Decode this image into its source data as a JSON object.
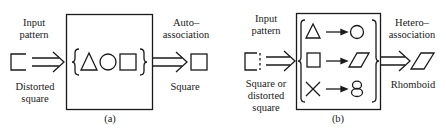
{
  "panel_a": {
    "input_label_line1": "Input",
    "input_label_line2": "pattern",
    "input_desc_line1": "Distorted",
    "input_desc_line2": "square",
    "output_label_line1": "Auto–",
    "output_label_line2": "association",
    "output_desc": "Square",
    "stored_patterns": [
      "triangle",
      "circle",
      "square"
    ],
    "caption": "(a)"
  },
  "panel_b": {
    "input_label_line1": "Input",
    "input_label_line2": "pattern",
    "input_desc_line1": "Square or",
    "input_desc_line2": "distorted",
    "input_desc_line3": "square",
    "output_label_line1": "Hetero–",
    "output_label_line2": "association",
    "output_desc": "Rhomboid",
    "pairs": [
      {
        "from": "triangle",
        "to": "circle"
      },
      {
        "from": "square",
        "to": "rhomboid"
      },
      {
        "from": "cross",
        "to": "eight"
      }
    ],
    "caption": "(b)"
  },
  "colors": {
    "stroke": "#1a1a1a",
    "background": "#ffffff"
  }
}
